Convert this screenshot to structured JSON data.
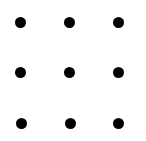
{
  "puzzle": {
    "type": "nine-dot-grid",
    "rows": 3,
    "cols": 3,
    "background": "#ffffff",
    "dot_color": "#000000",
    "dot_radius": 5.5,
    "dots": [
      {
        "row": 0,
        "col": 0,
        "x": 20,
        "y": 22
      },
      {
        "row": 0,
        "col": 1,
        "x": 69,
        "y": 22
      },
      {
        "row": 0,
        "col": 2,
        "x": 118,
        "y": 22
      },
      {
        "row": 1,
        "col": 0,
        "x": 20,
        "y": 72
      },
      {
        "row": 1,
        "col": 1,
        "x": 69,
        "y": 72
      },
      {
        "row": 1,
        "col": 2,
        "x": 118,
        "y": 72
      },
      {
        "row": 2,
        "col": 0,
        "x": 21,
        "y": 123
      },
      {
        "row": 2,
        "col": 1,
        "x": 70,
        "y": 123
      },
      {
        "row": 2,
        "col": 2,
        "x": 118,
        "y": 123
      }
    ]
  }
}
